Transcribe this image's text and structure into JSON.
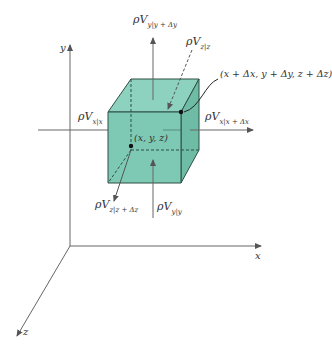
{
  "colors": {
    "cube_fill": "#7ec9b4",
    "cube_top": "#8fd3bf",
    "cube_side": "#6dbba5",
    "edge": "#2d4f45",
    "axis": "#555555",
    "text": "#333333"
  },
  "axes": {
    "x_label": "x",
    "y_label": "y",
    "z_label": "z"
  },
  "points": {
    "origin_corner": "(x, y, z)",
    "far_corner": "(x + Δx, y + Δy, z + Δz)"
  },
  "fluxes": [
    {
      "id": "x_in",
      "base": "ρV",
      "sub": "x|x"
    },
    {
      "id": "x_out",
      "base": "ρV",
      "sub": "x|x + Δx"
    },
    {
      "id": "y_in",
      "base": "ρV",
      "sub": "y|y"
    },
    {
      "id": "y_out",
      "base": "ρV",
      "sub": "y|y + Δy"
    },
    {
      "id": "z_in",
      "base": "ρV",
      "sub": "z|z"
    },
    {
      "id": "z_out",
      "base": "ρV",
      "sub": "z|z + Δz"
    }
  ]
}
